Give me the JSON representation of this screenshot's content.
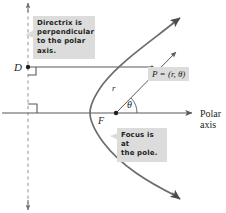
{
  "figure": {
    "background_color": "#ffffff",
    "ink_color": "#58595b",
    "text_color": "#231f20",
    "callout_fill": "#dcdcdc",
    "width": 226,
    "height": 213
  },
  "callouts": {
    "directrix": "Directrix is\nperpendicular\nto the polar axis.",
    "focus": "Focus is at\nthe pole."
  },
  "labels": {
    "point_D": "D",
    "point_F": "F",
    "segment_r": "r",
    "angle_theta": "θ",
    "point_P": "P = (r, θ)",
    "polar_axis": "Polar\naxis"
  },
  "geometry": {
    "directrix": {
      "type": "dashed-vertical-line",
      "x": 28,
      "y_top": 2,
      "y_bottom": 211,
      "arrow_top": true,
      "arrow_bottom": true
    },
    "polar_axis": {
      "type": "horizontal-line",
      "y": 113,
      "x_start": 2,
      "x_end": 196,
      "arrow_right": true
    },
    "focal_chord_line": {
      "type": "horizontal-line",
      "from": "D",
      "to": "P",
      "y": 67,
      "x_start": 28,
      "x_end": 152
    },
    "radius_ray": {
      "type": "ray",
      "from": "F",
      "through": "P",
      "x1": 116,
      "y1": 113,
      "x2": 181,
      "y2": 47,
      "arrow_end": true
    },
    "parabola": {
      "type": "curve",
      "opens": "right",
      "vertex_x": 90,
      "vertex_y": 113,
      "arrow_upper_right": true,
      "arrow_lower_right": true
    },
    "right_angle_markers": [
      {
        "at": "D",
        "x": 28,
        "y": 67
      },
      {
        "at": "axis-intercept",
        "x": 28,
        "y": 113
      }
    ],
    "angle_arc": {
      "label": "θ",
      "vertex": "F",
      "from_deg": 0,
      "to_deg": 45,
      "radius": 18
    },
    "points": [
      {
        "name": "D",
        "x": 28,
        "y": 67
      },
      {
        "name": "F",
        "x": 116,
        "y": 113
      },
      {
        "name": "P",
        "x": 152,
        "y": 67
      }
    ]
  }
}
